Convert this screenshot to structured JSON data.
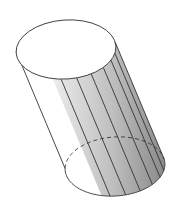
{
  "figure": {
    "width": 178,
    "height": 222,
    "background": "#ffffff",
    "stroke_color": "#333333",
    "stroke_width": 0.9,
    "top_ellipse": {
      "cx": 66,
      "cy": 49.5,
      "rx": 50,
      "ry": 29.5,
      "rotation_deg": -4
    },
    "bottom_ellipse": {
      "cx": 115,
      "cy": 166.5,
      "rx": 50,
      "ry": 29.5,
      "rotation_deg": -4
    },
    "bottom_ellipse_back_style": "dashed",
    "shading": {
      "from_angle_deg": -8,
      "to_angle_deg": 108,
      "gradient_stops": [
        {
          "offset": "0%",
          "color": "#ececec"
        },
        {
          "offset": "55%",
          "color": "#bdbdbd"
        },
        {
          "offset": "85%",
          "color": "#9a9a9a"
        },
        {
          "offset": "100%",
          "color": "#8a8a8a"
        }
      ]
    },
    "band_line_angles_deg": [
      98,
      80,
      62,
      44,
      28,
      14
    ],
    "left_generator_angle_deg": 183,
    "right_generator_angle_deg": -8
  }
}
